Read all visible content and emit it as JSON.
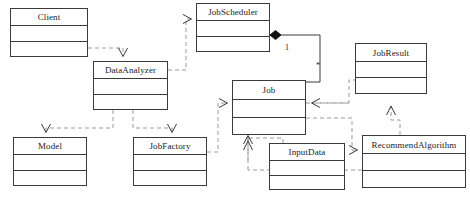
{
  "diagram": {
    "kind": "uml-class-diagram",
    "width": 470,
    "height": 208,
    "background": "#ffffff",
    "line_color": "#3a3a3a",
    "text_color": "#1a1a1a",
    "classes": [
      {
        "id": "client",
        "name": "Client",
        "x": 10,
        "y": 8,
        "w": 78,
        "h": 49,
        "name_h": 17
      },
      {
        "id": "data_analyzer",
        "name": "DataAnalyzer",
        "x": 93,
        "y": 61,
        "w": 75,
        "h": 49,
        "name_h": 17
      },
      {
        "id": "job_scheduler",
        "name": "JobScheduler",
        "x": 196,
        "y": 3,
        "w": 74,
        "h": 49,
        "name_h": 17
      },
      {
        "id": "job",
        "name": "Job",
        "x": 232,
        "y": 80,
        "w": 74,
        "h": 55,
        "name_h": 19
      },
      {
        "id": "job_result",
        "name": "JobResult",
        "x": 355,
        "y": 43,
        "w": 72,
        "h": 51,
        "name_h": 18
      },
      {
        "id": "model",
        "name": "Model",
        "x": 13,
        "y": 137,
        "w": 74,
        "h": 49,
        "name_h": 17
      },
      {
        "id": "job_factory",
        "name": "JobFactory",
        "x": 133,
        "y": 137,
        "w": 74,
        "h": 49,
        "name_h": 17
      },
      {
        "id": "input_data",
        "name": "InputData",
        "x": 269,
        "y": 143,
        "w": 76,
        "h": 47,
        "name_h": 17
      },
      {
        "id": "recommend_algorithm",
        "name": "RecommendAlgorithm",
        "x": 362,
        "y": 135,
        "w": 104,
        "h": 53,
        "name_h": 18
      }
    ],
    "multiplicities": [
      {
        "id": "scheduler-end",
        "label": "1",
        "x": 285,
        "y": 44
      },
      {
        "id": "job-end",
        "label": "*",
        "x": 316,
        "y": 62
      }
    ],
    "relations": [
      {
        "id": "client-to-dataanalyzer",
        "from": "client",
        "to": "data_analyzer",
        "type": "dependency"
      },
      {
        "id": "dataanalyzer-to-jobscheduler",
        "from": "data_analyzer",
        "to": "job_scheduler",
        "type": "dependency"
      },
      {
        "id": "dataanalyzer-to-model",
        "from": "data_analyzer",
        "to": "model",
        "type": "dependency"
      },
      {
        "id": "dataanalyzer-to-jobfactory",
        "from": "data_analyzer",
        "to": "job_factory",
        "type": "dependency"
      },
      {
        "id": "jobscheduler-to-job",
        "from": "job_scheduler",
        "to": "job",
        "type": "composition"
      },
      {
        "id": "jobfactory-to-job",
        "from": "job_factory",
        "to": "job",
        "type": "dependency"
      },
      {
        "id": "inputdata-to-job",
        "from": "input_data",
        "to": "job",
        "type": "dependency"
      },
      {
        "id": "job-to-jobresult",
        "from": "job",
        "to": "job_result",
        "type": "dependency"
      },
      {
        "id": "job-to-recommendalgorithm",
        "from": "job",
        "to": "recommend_algorithm",
        "type": "dependency"
      },
      {
        "id": "recommendalgorithm-to-jobresult",
        "from": "recommend_algorithm",
        "to": "job_result",
        "type": "dependency"
      },
      {
        "id": "recommendalgorithm-to-inputdata",
        "from": "recommend_algorithm",
        "to": "input_data",
        "type": "dependency"
      }
    ]
  }
}
